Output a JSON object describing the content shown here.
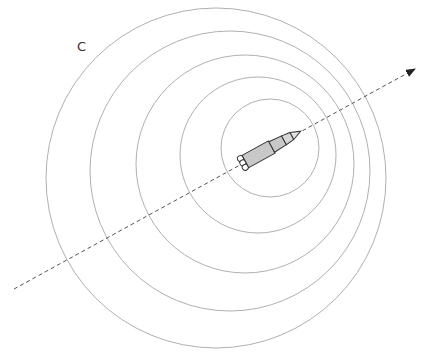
{
  "figure": {
    "label": "C",
    "colors": {
      "background": "#ffffff",
      "wavefront": "#b0b0b0",
      "trajectory": "#555555",
      "rocket_fill": "#c8c8c8",
      "rocket_stroke": "#333333"
    },
    "wavefronts": [
      {
        "cx": 216,
        "cy": 178,
        "r": 170
      },
      {
        "cx": 230,
        "cy": 171,
        "r": 140
      },
      {
        "cx": 245,
        "cy": 164,
        "r": 109
      },
      {
        "cx": 258,
        "cy": 155,
        "r": 78
      },
      {
        "cx": 270,
        "cy": 148,
        "r": 49
      }
    ],
    "trajectory": {
      "x1": 14,
      "y1": 289,
      "x2": 415,
      "y2": 69
    },
    "rocket": {
      "x": 270,
      "y": 148,
      "angle_deg": -28.8,
      "length": 66
    }
  }
}
